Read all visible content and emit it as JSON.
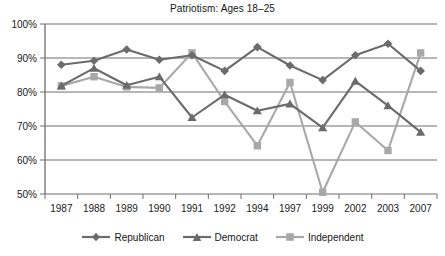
{
  "chart_data": {
    "type": "line",
    "title": "Patriotism: Ages 18–25",
    "xlabel": "",
    "ylabel": "",
    "ylim": [
      50,
      100
    ],
    "ytick_labels": [
      "100%",
      "90%",
      "80%",
      "70%",
      "60%",
      "50%"
    ],
    "ytick_values": [
      100,
      90,
      80,
      70,
      60,
      50
    ],
    "grid": true,
    "legend_position": "bottom",
    "categories": [
      "1987",
      "1988",
      "1989",
      "1990",
      "1991",
      "1992",
      "1994",
      "1997",
      "1999",
      "2002",
      "2003",
      "2007"
    ],
    "series": [
      {
        "name": "Republican",
        "marker": "diamond",
        "color": "#6b6b6b",
        "values": [
          88,
          89.2,
          92.5,
          89.5,
          90.8,
          86.2,
          93.2,
          87.8,
          83.5,
          90.8,
          94.2,
          86.2
        ]
      },
      {
        "name": "Democrat",
        "marker": "triangle",
        "color": "#6b6b6b",
        "values": [
          81.8,
          87,
          82,
          84.5,
          72.5,
          79.2,
          74.5,
          76.5,
          69.5,
          83.2,
          76,
          68.2
        ]
      },
      {
        "name": "Independent",
        "marker": "square",
        "color": "#a8a8a8",
        "values": [
          81.8,
          84.5,
          81.5,
          81.2,
          91.5,
          77.2,
          64.2,
          82.8,
          50.5,
          71.2,
          62.8,
          91.5
        ]
      }
    ]
  },
  "legend": {
    "items": [
      {
        "label": "Republican"
      },
      {
        "label": "Democrat"
      },
      {
        "label": "Independent"
      }
    ]
  }
}
